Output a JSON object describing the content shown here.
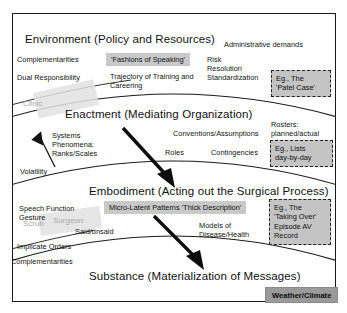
{
  "figure": {
    "top_tag": "Climate/Weather",
    "bottom_tag": "Weather/Climate"
  },
  "bands": [
    {
      "id": "environment",
      "title": "Environment (Policy and Resources)",
      "labels": [
        "Complementarities",
        "Dual Responsibility",
        "Administrative demands",
        "Risk",
        "Resolution",
        "Standardization",
        "Trajectory of Training and",
        "Careering"
      ],
      "chip": "'Fashions of Speaking'",
      "example": "Eg., The\n'Patel Case'"
    },
    {
      "id": "enactment",
      "title": "Enactment (Mediating Organization)",
      "labels": [
        "Systems",
        "Phenomena:",
        "Ranks/Scales",
        "Volatility",
        "Conventions/Assumptions",
        "Roles",
        "Contingencies",
        "Rosters:",
        "planned/actual"
      ],
      "example": "Eg., Lists\nday-by-day"
    },
    {
      "id": "embodiment",
      "title": "Embodiment (Acting out the Surgical Process)",
      "labels": [
        "Speech Function",
        "Gesture",
        "Said/unsaid",
        "Models of",
        "Disease/Health",
        "Implicate Orders",
        "Complementarities"
      ],
      "chip": "Micro-Latent Patterns 'Thick Description'",
      "example": "Eg., The\n'Taking Over'\nEpisode AV\nRecord"
    },
    {
      "id": "substance",
      "title": "Substance (Materialization of Messages)",
      "labels": [],
      "chip": "",
      "example": ""
    }
  ],
  "watermarks": [
    "Clinic",
    "Scrub",
    "Surgeon"
  ],
  "colors": {
    "chip_gray": "#c9c9c9",
    "tag_gray": "#9a9a9a",
    "example_gray": "#c4c4c4",
    "line": "#1a1a1a",
    "ghost": "#a9a9a9"
  }
}
